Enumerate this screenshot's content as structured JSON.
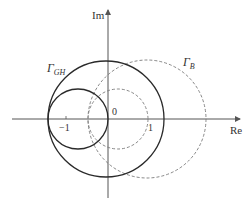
{
  "diagram": {
    "type": "nyquist-plot-circles",
    "axes": {
      "real_label": "Re",
      "imag_label": "Im",
      "origin_label": "0",
      "tick_minus_one": "−1",
      "tick_one": "1"
    },
    "curves": {
      "gamma_gh": {
        "label_main": "Γ",
        "label_sub": "GH",
        "style": "solid"
      },
      "gamma_b": {
        "label_main": "Γ",
        "label_sub": "B",
        "style": "dashed"
      }
    },
    "colors": {
      "solid": "#2a2a2a",
      "dashed": "#7a7a7a",
      "axis": "#555555",
      "text": "#333333"
    }
  }
}
